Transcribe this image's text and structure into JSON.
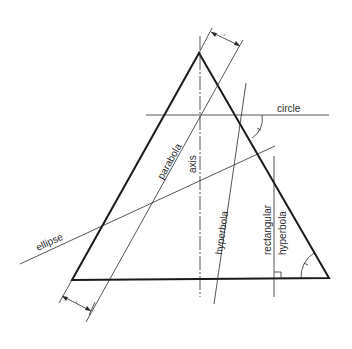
{
  "figure": {
    "labels": {
      "circle": "circle",
      "ellipse": "ellipse",
      "parabola": "parabola",
      "axis": "axis",
      "hyperbola": "hyperbola",
      "rectangular": "rectangular",
      "rectangular_hyperbola": "hyperbola",
      "dim_top": "=",
      "dim_bottom": "="
    },
    "colors": {
      "line": "#2b2b2b",
      "outline": "#1a1a1a",
      "background": "#ffffff"
    },
    "cone_triangle": {
      "apex": [
        199,
        53
      ],
      "base_left": [
        72,
        280
      ],
      "base_right": [
        329,
        278
      ]
    },
    "section_lines": [
      {
        "name": "circle",
        "from": [
          146,
          115
        ],
        "to": [
          329,
          115
        ]
      },
      {
        "name": "ellipse",
        "from": [
          20,
          264
        ],
        "to": [
          275,
          146
        ]
      },
      {
        "name": "parabola",
        "from": [
          86,
          322
        ],
        "to": [
          240,
          45
        ]
      },
      {
        "name": "axis",
        "from": [
          200,
          36
        ],
        "to": [
          200,
          297
        ]
      },
      {
        "name": "hyperbola",
        "from": [
          214,
          304
        ],
        "to": [
          246,
          83
        ]
      },
      {
        "name": "rectangular hyperbola",
        "from": [
          274,
          156
        ],
        "to": [
          274,
          297
        ]
      }
    ]
  }
}
